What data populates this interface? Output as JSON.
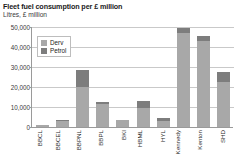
{
  "title": "Fleet fuel consumption per £ million",
  "subtitle": "Litres, £ million",
  "legend": {
    "items": [
      {
        "label": "Derv",
        "color": "#a8a8a8"
      },
      {
        "label": "Petrol",
        "color": "#7d7d7d"
      }
    ]
  },
  "axis": {
    "y_ticks": [
      "0",
      "10,000",
      "20,000",
      "30,000",
      "40,000",
      "50,000"
    ]
  },
  "chart_data": {
    "type": "bar",
    "stacked": true,
    "title": "Fleet fuel consumption per £ million",
    "subtitle": "Litres, £ million",
    "xlabel": "",
    "ylabel": "Litres, £ million",
    "ylim": [
      0,
      50000
    ],
    "yticks": [
      0,
      10000,
      20000,
      30000,
      40000,
      50000
    ],
    "grid": true,
    "legend_position": "top-left-inside",
    "categories": [
      "BBCL",
      "BBCEL",
      "BBPNL",
      "BBPL",
      "BKI",
      "HBML",
      "HYL",
      "Kennedy",
      "Kenton",
      "SHD"
    ],
    "series": [
      {
        "name": "Derv",
        "color": "#a8a8a8",
        "values": [
          900,
          3200,
          20000,
          11500,
          3300,
          9500,
          3200,
          47000,
          43000,
          22500
        ]
      },
      {
        "name": "Petrol",
        "color": "#7d7d7d",
        "values": [
          200,
          400,
          8500,
          1200,
          400,
          3500,
          1300,
          2500,
          2500,
          5000
        ]
      }
    ],
    "totals": [
      1100,
      3600,
      28500,
      12700,
      3700,
      13000,
      4500,
      49500,
      45500,
      27500
    ]
  }
}
